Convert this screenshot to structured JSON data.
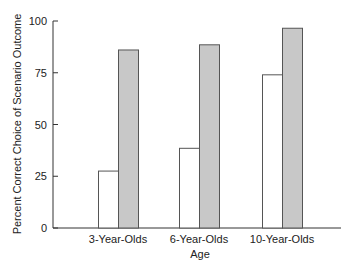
{
  "chart_data": {
    "type": "bar",
    "title": "",
    "xlabel": "Age",
    "ylabel": "Percent Correct Choice of Scenario Outcome",
    "categories": [
      "3-Year-Olds",
      "6-Year-Olds",
      "10-Year-Olds"
    ],
    "series": [
      {
        "name": "Condition 1 (white)",
        "color": "#ffffff",
        "values": [
          27.5,
          38.5,
          74
        ]
      },
      {
        "name": "Condition 2 (gray)",
        "color": "#c8c8c8",
        "values": [
          86,
          88.5,
          96.5
        ]
      }
    ],
    "ylim": [
      0,
      100
    ],
    "yticks": [
      0,
      25,
      50,
      75,
      100
    ],
    "grid": false,
    "legend": "none"
  },
  "colors": {
    "axis": "#333333",
    "bar_border": "#555555",
    "gray_fill": "#c8c8c8",
    "white_fill": "#ffffff"
  }
}
